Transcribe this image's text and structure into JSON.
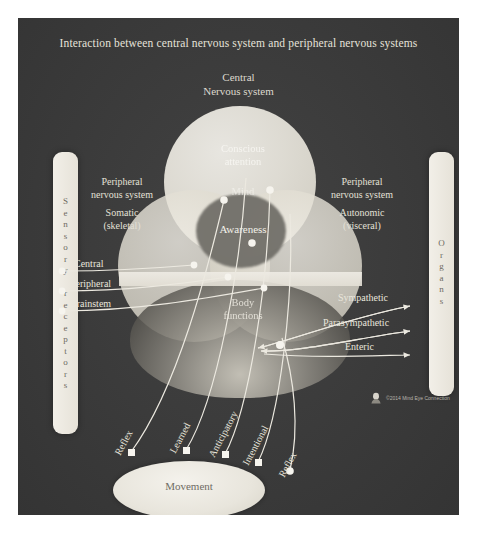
{
  "diagram": {
    "title": "Interaction between central nervous system and peripheral nervous systems",
    "background_color": "#3b3b3b",
    "panel_text_color": "#e6e3da"
  },
  "central": {
    "heading_line1": "Central",
    "heading_line2": "Nervous system",
    "zones": {
      "conscious_line1": "Conscious",
      "conscious_line2": "attention",
      "mind": "Mind",
      "awareness": "Awareness",
      "body_line1": "Body",
      "body_line2": "functions"
    }
  },
  "left_group": {
    "line1": "Peripheral",
    "line2": "nervous system",
    "line3": "Somatic",
    "line4": "(skeletal)"
  },
  "right_group": {
    "line1": "Peripheral",
    "line2": "nervous system",
    "line3": "Autonomic",
    "line4": "(visceral)"
  },
  "left_bar": {
    "label": "Sensory receptors",
    "letters": [
      "S",
      "e",
      "n",
      "s",
      "o",
      "r",
      "y",
      " ",
      "r",
      "e",
      "c",
      "e",
      "p",
      "t",
      "o",
      "r",
      "s"
    ]
  },
  "right_bar": {
    "label": "Organs",
    "letters": [
      "O",
      "r",
      "g",
      "a",
      "n",
      "s"
    ]
  },
  "afferent_labels": [
    {
      "label": "Central"
    },
    {
      "label": "Peripheral"
    },
    {
      "label": "Brainstem"
    }
  ],
  "efferent_labels": [
    {
      "label": "Sympathetic"
    },
    {
      "label": "Parasympathetic"
    },
    {
      "label": "Enteric"
    }
  ],
  "movement": {
    "label": "Movement",
    "pathways": [
      {
        "label": "Reflex"
      },
      {
        "label": "Learned"
      },
      {
        "label": "Anticipatory"
      },
      {
        "label": "Intentional"
      },
      {
        "label": "Reflex"
      }
    ]
  },
  "credit": {
    "text": "©2014 Mind Eye Connection"
  }
}
